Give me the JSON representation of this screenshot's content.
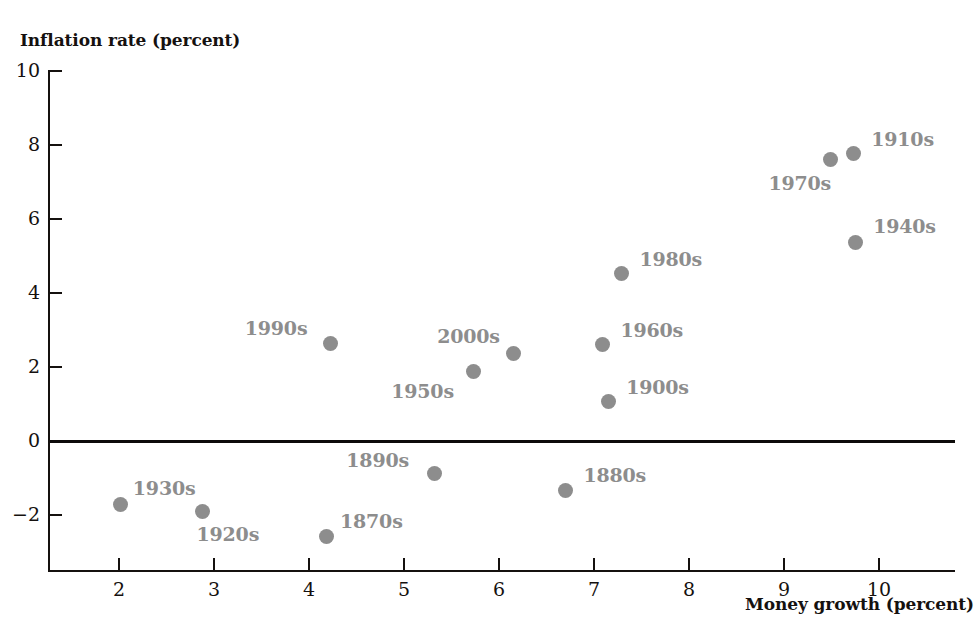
{
  "chart_data": {
    "type": "scatter",
    "title": "",
    "xlabel": "Money growth (percent)",
    "ylabel": "Inflation rate (percent)",
    "xlim": [
      1.3,
      10.7
    ],
    "ylim": [
      -3.2,
      10
    ],
    "xticks": [
      2,
      3,
      4,
      5,
      6,
      7,
      8,
      9,
      10
    ],
    "yticks": [
      -2,
      0,
      2,
      4,
      6,
      8,
      10
    ],
    "xtick_labels": [
      "2",
      "3",
      "4",
      "5",
      "6",
      "7",
      "8",
      "9",
      "10"
    ],
    "ytick_labels": [
      "−2",
      "0",
      "2",
      "4",
      "6",
      "8",
      "10"
    ],
    "grid": false,
    "legend": "none",
    "zero_reference_line": 0,
    "marker_color": "#8d8d8d",
    "label_color": "#8d8d8d",
    "axis_color": "#15110f",
    "points": [
      {
        "label": "1930s",
        "x": 2.03,
        "y": -1.75,
        "label_dx": 12,
        "label_dy": -28
      },
      {
        "label": "1920s",
        "x": 2.89,
        "y": -1.92,
        "label_dx": -6,
        "label_dy": 12
      },
      {
        "label": "1870s",
        "x": 4.19,
        "y": -2.6,
        "label_dx": 14,
        "label_dy": -26
      },
      {
        "label": "1990s",
        "x": 4.24,
        "y": 2.62,
        "label_dx": -86,
        "label_dy": -26
      },
      {
        "label": "1890s",
        "x": 5.33,
        "y": -0.9,
        "label_dx": -88,
        "label_dy": -24
      },
      {
        "label": "1950s",
        "x": 5.74,
        "y": 1.85,
        "label_dx": -82,
        "label_dy": 8
      },
      {
        "label": "2000s",
        "x": 6.16,
        "y": 2.35,
        "label_dx": -76,
        "label_dy": -28
      },
      {
        "label": "1880s",
        "x": 6.71,
        "y": -1.36,
        "label_dx": 18,
        "label_dy": -26
      },
      {
        "label": "1900s",
        "x": 7.16,
        "y": 1.03,
        "label_dx": 18,
        "label_dy": -26
      },
      {
        "label": "1960s",
        "x": 7.1,
        "y": 2.58,
        "label_dx": 18,
        "label_dy": -26
      },
      {
        "label": "1980s",
        "x": 7.3,
        "y": 4.5,
        "label_dx": 18,
        "label_dy": -26
      },
      {
        "label": "1970s",
        "x": 9.5,
        "y": 7.58,
        "label_dx": -62,
        "label_dy": 12
      },
      {
        "label": "1910s",
        "x": 9.74,
        "y": 7.73,
        "label_dx": 18,
        "label_dy": -26
      },
      {
        "label": "1940s",
        "x": 9.76,
        "y": 5.33,
        "label_dx": 18,
        "label_dy": -28
      }
    ]
  }
}
